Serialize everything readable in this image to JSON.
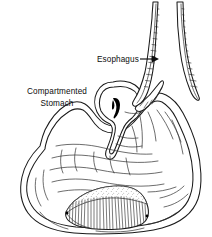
{
  "figure": {
    "title": "Compartmented Stomach",
    "background_color": "#ffffff",
    "ink_color": "#1a1a1a",
    "style": "black-and-white line drawing with stippled walls and hatching",
    "width": 212,
    "height": 237
  },
  "labels": {
    "esophagus": {
      "text": "Esophagus",
      "x": 97,
      "y": 62,
      "anchor": "start",
      "has_arrow": true,
      "arrow_direction": "right"
    },
    "compartmented_stomach": {
      "line1": "Compartmented",
      "line2": "Stomach",
      "x": 57,
      "y1": 94,
      "y2": 106,
      "anchor": "middle",
      "has_arrow": false
    }
  },
  "structures": [
    {
      "name": "esophagus-tube",
      "description": "Narrow vertical tube at upper right formed by two stippled walls descending from the top edge"
    },
    {
      "name": "upper-pouch",
      "description": "Small rounded compartment at upper middle containing a solid dark crescent mark"
    },
    {
      "name": "dark-crescent-mark",
      "description": "Solid black comma-shaped mark inside the upper pouch"
    },
    {
      "name": "stomach-body",
      "description": "Large rounded main stomach chamber occupying the lower two-thirds"
    },
    {
      "name": "rugae-folds",
      "description": "Wavy interior lines representing mucosal folds"
    },
    {
      "name": "lower-hatched-compartment",
      "description": "Dome-shaped structure at the bottom with dense vertical hatching and a stippled upper band"
    }
  ]
}
